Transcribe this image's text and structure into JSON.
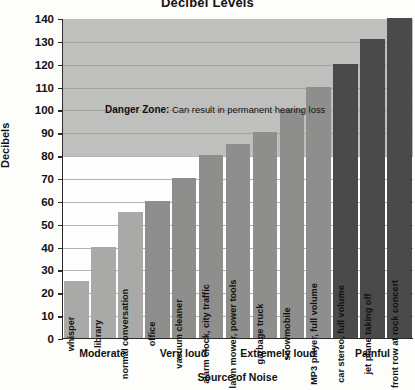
{
  "chart_data": {
    "type": "bar",
    "title": "Decibel Levels",
    "xlabel": "Source of Noise",
    "ylabel": "Decibels",
    "ylim": [
      0,
      140
    ],
    "ytick_step": 10,
    "yticks": [
      "140",
      "130",
      "120",
      "110",
      "100",
      "90",
      "80",
      "70",
      "60",
      "50",
      "40",
      "30",
      "20",
      "10",
      "0"
    ],
    "grid": true,
    "legend": "none",
    "categories": [
      "whisper",
      "library",
      "normal conversation",
      "office",
      "vacuum cleaner",
      "alarm clock, city traffic",
      "lawn mower, power tools",
      "garbage truck",
      "snowmobile",
      "MP3 player, full volume",
      "car stereo, full volume",
      "jet plane taking off",
      "front row at rock concert"
    ],
    "values": [
      25,
      40,
      55,
      60,
      70,
      80,
      85,
      90,
      100,
      110,
      120,
      131,
      140
    ],
    "bar_shades": [
      "light",
      "light",
      "light",
      "mid",
      "mid",
      "mid",
      "mid",
      "mid",
      "mid",
      "mid",
      "dark",
      "dark",
      "dark"
    ],
    "annotations": [
      {
        "name": "danger-zone",
        "bold_text": "Danger Zone:",
        "text": " Can result in permanent hearing loss",
        "band_from": 80,
        "band_to": 140
      }
    ],
    "groups": [
      {
        "label": "Moderate",
        "span": 3
      },
      {
        "label": "Very loud",
        "span": 3
      },
      {
        "label": "Extremely loud",
        "span": 4
      },
      {
        "label": "Painful",
        "span": 3
      }
    ],
    "colors": {
      "band": "#bfbfbd",
      "bar_light": "#a9a9a7",
      "bar_mid": "#8e8e8c",
      "bar_dark": "#4a4a4a",
      "axis": "#2b2b2b",
      "grid": "#9a9a98",
      "background": "#fefefe"
    }
  }
}
